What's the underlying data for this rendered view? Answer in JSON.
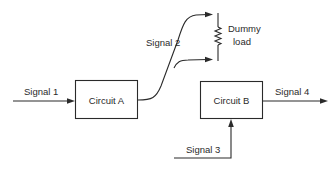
{
  "diagram": {
    "blocks": {
      "circuit_a": {
        "label": "Circuit A"
      },
      "circuit_b": {
        "label": "Circuit B"
      }
    },
    "signals": {
      "signal_1": {
        "label": "Signal 1"
      },
      "signal_2": {
        "label": "Signal 2"
      },
      "signal_3": {
        "label": "Signal 3"
      },
      "signal_4": {
        "label": "Signal 4"
      }
    },
    "load": {
      "line1": "Dummy",
      "line2": "load",
      "icon": "resistor-icon"
    },
    "colors": {
      "stroke": "#2a2a2a",
      "background": "#ffffff"
    }
  }
}
